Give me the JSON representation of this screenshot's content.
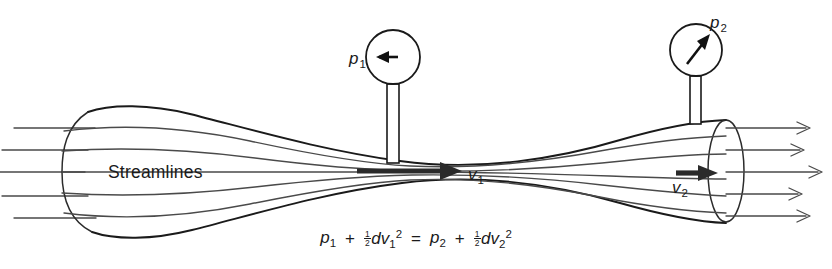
{
  "figure": {
    "background_color": "#ffffff",
    "line_color": "#1a1a1a",
    "streamline_color": "#4a4a4a"
  },
  "labels": {
    "streamlines": "Streamlines",
    "pressure_1_base": "p",
    "pressure_1_sub": "1",
    "pressure_2_base": "p",
    "pressure_2_sub": "2",
    "velocity_1_base": "v",
    "velocity_1_sub": "1",
    "velocity_2_base": "v",
    "velocity_2_sub": "2"
  },
  "equation": {
    "full_text": "p1 + ½dv1² = p2 + ½dv2²",
    "lhs": {
      "term1_base": "p",
      "term1_sub": "1",
      "operator": "+",
      "frac_num": "1",
      "frac_den": "2",
      "density": "d",
      "term2_base": "v",
      "term2_sub": "1",
      "term2_sup": "2"
    },
    "relation": "=",
    "rhs": {
      "term1_base": "p",
      "term1_sub": "2",
      "operator": "+",
      "frac_num": "1",
      "frac_den": "2",
      "density": "d",
      "term2_base": "v",
      "term2_sub": "2",
      "term2_sup": "2"
    }
  },
  "gauges": [
    {
      "name": "pressure-gauge-1",
      "label_base": "p",
      "label_sub": "1",
      "needle_direction": "left",
      "cx": 393,
      "cy": 57,
      "r": 27
    },
    {
      "name": "pressure-gauge-2",
      "label_base": "p",
      "label_sub": "2",
      "needle_direction": "up-right",
      "cx": 696,
      "cy": 50,
      "r": 26
    }
  ],
  "velocity_arrows": [
    {
      "name": "velocity-arrow-1",
      "label_base": "v",
      "label_sub": "1",
      "location": "throat",
      "direction": "right"
    },
    {
      "name": "velocity-arrow-2",
      "label_base": "v",
      "label_sub": "2",
      "location": "wide-outlet",
      "direction": "right"
    }
  ],
  "streamline_count_inlet": 5,
  "streamline_count_outlet": 5
}
